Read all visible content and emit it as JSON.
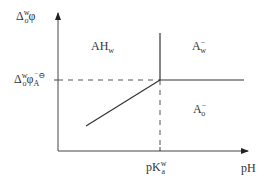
{
  "diagram": {
    "type": "phase-diagram",
    "y_axis_label": {
      "base": "Δ",
      "sup": "w",
      "sub": "o",
      "tail": "φ"
    },
    "y_tick_label": {
      "base": "Δ",
      "sup": "w",
      "sub": "o",
      "mid": "φ",
      "sub2": "A",
      "sup2": "⁻⊖"
    },
    "x_axis_label": "pH",
    "x_tick_label": {
      "base": "pK",
      "sup": "w",
      "sub": "a"
    },
    "regions": [
      {
        "id": "AHw",
        "base": "AH",
        "sub": "w",
        "sup": ""
      },
      {
        "id": "Aw",
        "base": "A",
        "sub": "w",
        "sup": "−"
      },
      {
        "id": "Ao",
        "base": "A",
        "sub": "o",
        "sup": "−"
      }
    ],
    "line_color": "#333333",
    "dash_color": "#444444"
  }
}
